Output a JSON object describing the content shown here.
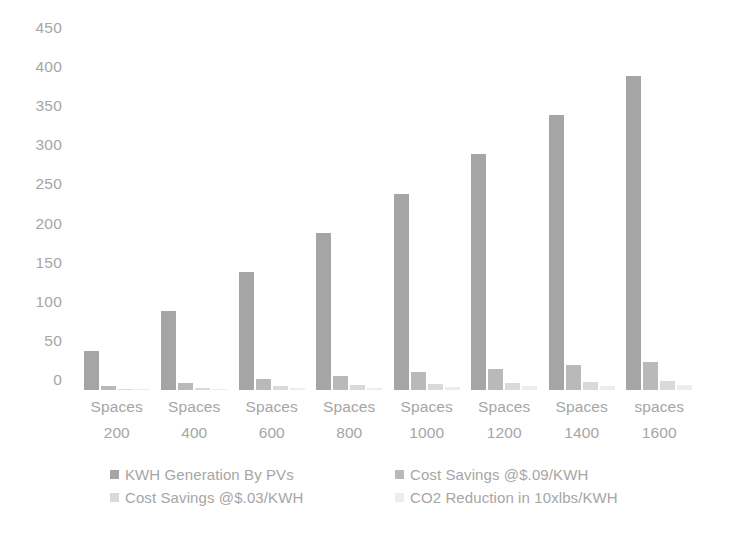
{
  "chart_data": {
    "type": "bar",
    "title": "",
    "subtitle": "",
    "xlabel": "",
    "ylabel": "",
    "ylim": [
      0,
      450
    ],
    "y_ticks": [
      0,
      50,
      100,
      150,
      200,
      250,
      300,
      350,
      400,
      450
    ],
    "grid": false,
    "legend_position": "bottom",
    "grouping": "grouped",
    "categories": [
      "Spaces 200",
      "Spaces 400",
      "Spaces 600",
      "Spaces 800",
      "Spaces 1000",
      "Spaces 1200",
      "Spaces 1400",
      "spaces 1600"
    ],
    "category_lines": [
      {
        "name": "Spaces",
        "value": "200"
      },
      {
        "name": "Spaces",
        "value": "400"
      },
      {
        "name": "Spaces",
        "value": "600"
      },
      {
        "name": "Spaces",
        "value": "800"
      },
      {
        "name": "Spaces",
        "value": "1000"
      },
      {
        "name": "Spaces",
        "value": "1200"
      },
      {
        "name": "Spaces",
        "value": "1400"
      },
      {
        "name": "spaces",
        "value": "1600"
      }
    ],
    "series": [
      {
        "name": "KWH Generation By PVs",
        "color": "#a5a5a5",
        "values": [
          50,
          101,
          151,
          201,
          251,
          302,
          352,
          402
        ]
      },
      {
        "name": "Cost Savings @$.09/KWH",
        "color": "#b9b9b9",
        "values": [
          4.5,
          9,
          13.6,
          18.1,
          22.6,
          27.2,
          31.7,
          36.2
        ]
      },
      {
        "name": "Cost Savings @$.03/KWH",
        "color": "#d9d9d9",
        "values": [
          1.5,
          3,
          4.5,
          6,
          7.5,
          9.1,
          10.6,
          12.1
        ]
      },
      {
        "name": "CO2 Reduction in 10xlbs/KWH",
        "color": "#ededed",
        "values": [
          0.8,
          1.6,
          2.4,
          3.2,
          4,
          4.8,
          5.6,
          6.4
        ]
      }
    ]
  },
  "axis": {
    "y_tick_labels": [
      "450",
      "400",
      "350",
      "300",
      "250",
      "200",
      "150",
      "100",
      "50",
      "0"
    ]
  },
  "legend": {
    "entries": [
      {
        "label": "KWH Generation By PVs",
        "color": "#a5a5a5"
      },
      {
        "label": "Cost Savings @$.09/KWH",
        "color": "#b9b9b9"
      },
      {
        "label": "Cost Savings @$.03/KWH",
        "color": "#d9d9d9"
      },
      {
        "label": "CO2 Reduction in 10xlbs/KWH",
        "color": "#ededed"
      }
    ]
  }
}
